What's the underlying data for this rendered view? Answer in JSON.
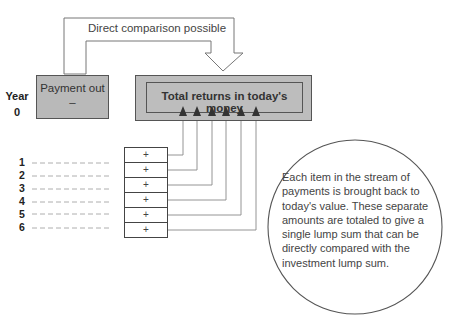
{
  "diagram": {
    "comparison_arrow_label": "Direct comparison possible",
    "payment_box": {
      "title": "Payment out",
      "sign": "–"
    },
    "year_label": {
      "title": "Year",
      "value": "0"
    },
    "total_box": {
      "label": "Total returns in today's money"
    },
    "years": [
      {
        "label": "1",
        "sign": "+"
      },
      {
        "label": "2",
        "sign": "+"
      },
      {
        "label": "3",
        "sign": "+"
      },
      {
        "label": "4",
        "sign": "+"
      },
      {
        "label": "5",
        "sign": "+"
      },
      {
        "label": "6",
        "sign": "+"
      }
    ],
    "note": "Each item in the stream of payments is brought back to today's value. These separate amounts are totaled to give a single lump sum that can be directly compared with the investment lump sum.",
    "colors": {
      "box_fill": "#bdbdbd",
      "line": "#555555",
      "connector": "#888888"
    }
  }
}
